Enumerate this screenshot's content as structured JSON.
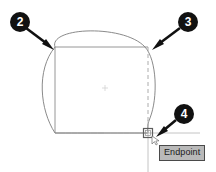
{
  "scene": {
    "app_context": "cad-drawing-canvas",
    "background_color": "#ffffff",
    "geometry_color": "#8c8c8c",
    "outline_color": "#5a5a5a"
  },
  "callouts": [
    {
      "id": "callout-2",
      "label": "2",
      "points_to": "rectangle-top-left-corner"
    },
    {
      "id": "callout-3",
      "label": "3",
      "points_to": "arc-top-right"
    },
    {
      "id": "callout-4",
      "label": "4",
      "points_to": "endpoint-snap-marker"
    }
  ],
  "snap": {
    "tooltip_label": "Endpoint",
    "marker_name": "endpoint-square-marker",
    "marker_x": 148,
    "marker_y": 133
  },
  "shapes": {
    "rectangle": {
      "left": 55,
      "top": 47,
      "right": 148,
      "bottom": 133
    },
    "arc_label": "dome-arc",
    "dashed_edge_label": "dashed-vertical-edge",
    "center_point_label": "center-point-marker"
  }
}
